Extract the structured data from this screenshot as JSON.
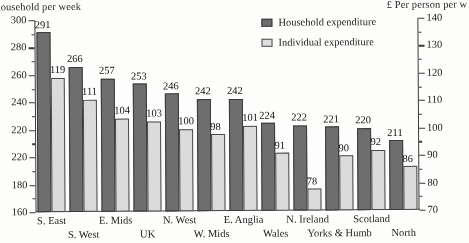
{
  "axes": {
    "left_title": "household per week",
    "right_title": "£ Per person per w",
    "left_ticks": [
      "300",
      "280",
      "260",
      "240",
      "220",
      "220",
      "180",
      "160"
    ],
    "right_ticks": [
      "140",
      "130",
      "120",
      "110",
      "100",
      "90",
      "80",
      "70"
    ]
  },
  "legend": {
    "items": [
      {
        "label": "Household expenditure",
        "color": "#6e6e6e"
      },
      {
        "label": "Individual expenditure",
        "color": "#d9d9d9"
      }
    ]
  },
  "chart_data": {
    "type": "bar",
    "title": "",
    "xlabel": "",
    "ylabel": "household per week",
    "y2label": "£ Per person per w",
    "grid": false,
    "legend_position": "top-right",
    "ylim": [
      160,
      300
    ],
    "y2lim": [
      70,
      140
    ],
    "categories": [
      "S. East",
      "S. West",
      "E. Mids",
      "UK",
      "N. West",
      "W. Mids",
      "E. Anglia",
      "Wales",
      "N. Ireland",
      "Yorks & Humb",
      "Scotland",
      "North"
    ],
    "category_rows": [
      0,
      1,
      0,
      1,
      0,
      1,
      0,
      1,
      0,
      1,
      0,
      1
    ],
    "series": [
      {
        "name": "Household expenditure",
        "axis": "left",
        "values": [
          291,
          266,
          257,
          253,
          246,
          242,
          242,
          224,
          222,
          221,
          220,
          211
        ]
      },
      {
        "name": "Individual expenditure",
        "axis": "right",
        "values": [
          119,
          111,
          104,
          103,
          100,
          98,
          101,
          91,
          78,
          90,
          92,
          86
        ]
      }
    ]
  }
}
